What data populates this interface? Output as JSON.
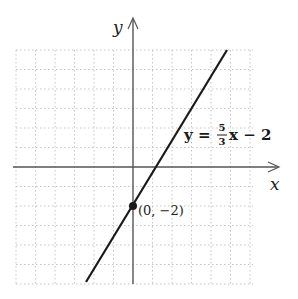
{
  "figure": {
    "axes": {
      "x_label": "x",
      "y_label": "y",
      "x_range": [
        -6,
        6
      ],
      "y_range": [
        -6,
        6
      ],
      "grid": "dotted",
      "unit_px": 19.5
    },
    "line": {
      "equation_prefix": "y = ",
      "slope_numerator": "5",
      "slope_denominator": "3",
      "equation_suffix": "x − 2",
      "slope": 1.6667,
      "intercept": -2,
      "color": "#1a1a1a"
    },
    "point": {
      "label": "(0, −2)",
      "x": 0,
      "y": -2
    },
    "colors": {
      "grid": "#c8c8c8",
      "axis": "#555555",
      "line": "#1a1a1a"
    }
  }
}
